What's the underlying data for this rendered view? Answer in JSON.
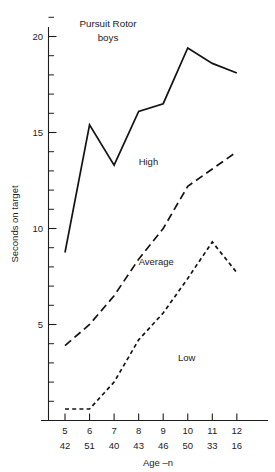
{
  "chart_data": {
    "type": "line",
    "title": "Pursuit Rotor",
    "subtitle": "boys",
    "xlabel": "Age –n",
    "ylabel": "Seconds on target",
    "categories": [
      "5",
      "6",
      "7",
      "8",
      "9",
      "10",
      "11",
      "12"
    ],
    "n_values": [
      "42",
      "51",
      "40",
      "43",
      "46",
      "50",
      "33",
      "16"
    ],
    "xlim": [
      5,
      12
    ],
    "ylim": [
      0,
      21
    ],
    "ytick_labels": [
      "5",
      "10",
      "15",
      "20"
    ],
    "ytick_values": [
      5,
      10,
      15,
      20
    ],
    "yminor_step": 1,
    "grid": false,
    "legend_position": "inline-annotations",
    "series": [
      {
        "name": "High",
        "style": "solid",
        "label_x": 8.0,
        "label_y": 13.3,
        "values": [
          8.75,
          15.4,
          13.3,
          16.1,
          16.5,
          19.4,
          18.6,
          18.1
        ]
      },
      {
        "name": "Average",
        "style": "long-dash",
        "label_x": 8.0,
        "label_y": 8.1,
        "values": [
          3.9,
          5.0,
          6.5,
          8.4,
          10.0,
          12.2,
          13.1,
          14.0
        ]
      },
      {
        "name": "Low",
        "style": "short-dash",
        "label_x": 9.6,
        "label_y": 3.1,
        "values": [
          0.6,
          0.6,
          2.0,
          4.2,
          5.6,
          7.4,
          9.3,
          7.7
        ]
      }
    ]
  },
  "figure": {
    "title_line1": "Pursuit Rotor",
    "title_line2": "boys",
    "ylabel": "Seconds on target",
    "xlabel": "Age –n"
  },
  "colors": {
    "ink": "#141414",
    "axis": "#1d1d1d",
    "background": "#ffffff"
  }
}
